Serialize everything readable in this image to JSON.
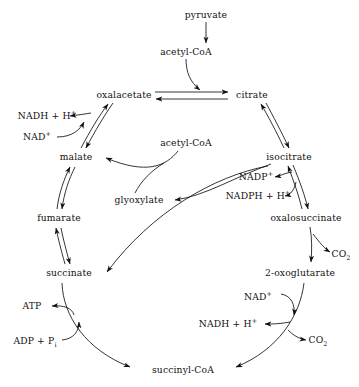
{
  "diagram": {
    "stroke_color": "#111111",
    "background_color": "#ffffff",
    "metabolites": [
      {
        "id": "pyruvate",
        "label": "pyruvate",
        "x": 206,
        "y": 15
      },
      {
        "id": "acetyl-coa-top",
        "label": "acetyl-CoA",
        "x": 186,
        "y": 52
      },
      {
        "id": "oxalacetate",
        "label": "oxalacetate",
        "x": 124,
        "y": 95
      },
      {
        "id": "citrate",
        "label": "citrate",
        "x": 252,
        "y": 95
      },
      {
        "id": "malate",
        "label": "malate",
        "x": 76,
        "y": 157
      },
      {
        "id": "acetyl-coa-mid",
        "label": "acetyl-CoA",
        "x": 186,
        "y": 143
      },
      {
        "id": "isocitrate",
        "label": "isocitrate",
        "x": 289,
        "y": 157
      },
      {
        "id": "glyoxylate",
        "label": "glyoxylate",
        "x": 139,
        "y": 200
      },
      {
        "id": "fumarate",
        "label": "fumarate",
        "x": 59,
        "y": 218
      },
      {
        "id": "oxalosuccinate",
        "label": "oxalosuccinate",
        "x": 306,
        "y": 218
      },
      {
        "id": "succinate",
        "label": "succinate",
        "x": 69,
        "y": 273
      },
      {
        "id": "2-oxoglutarate",
        "label": "2-oxoglutarate",
        "x": 300,
        "y": 273
      },
      {
        "id": "succinyl-coa",
        "label": "succinyl-CoA",
        "x": 183,
        "y": 370
      }
    ],
    "cofactors": [
      {
        "id": "nadh-h-malate",
        "label": "NADH + H",
        "sup": "+",
        "x": 47,
        "y": 116
      },
      {
        "id": "nad-malate",
        "label": "NAD",
        "sup": "+",
        "x": 37,
        "y": 137
      },
      {
        "id": "nadp-isocit",
        "label": "NADP",
        "sup": "+",
        "x": 256,
        "y": 177
      },
      {
        "id": "nadph-h-isocit",
        "label": "NADPH + H",
        "sup": "+",
        "x": 258,
        "y": 196
      },
      {
        "id": "co2-oxalosucc",
        "label": "CO",
        "sub": "2",
        "x": 341,
        "y": 254
      },
      {
        "id": "nad-oxoglut",
        "label": "NAD",
        "sup": "+",
        "x": 258,
        "y": 297
      },
      {
        "id": "nadh-h-oxoglut",
        "label": "NADH + H",
        "sup": "+",
        "x": 228,
        "y": 324
      },
      {
        "id": "co2-oxoglut",
        "label": "CO",
        "sub": "2",
        "x": 318,
        "y": 340
      },
      {
        "id": "atp",
        "label": "ATP",
        "x": 32,
        "y": 306
      },
      {
        "id": "adp-pi",
        "label": "ADP + P",
        "sub": "i",
        "x": 35,
        "y": 341
      }
    ],
    "reactions": [
      {
        "id": "pyruvate-to-acetylcoa",
        "from": "pyruvate",
        "to": "acetyl-coa-top",
        "reversible": false
      },
      {
        "id": "acetylcoa-condensation",
        "from": "acetyl-coa-top",
        "to": "citrate-synthase-point",
        "reversible": false
      },
      {
        "id": "oxalacetate-to-citrate",
        "from": "oxalacetate",
        "to": "citrate",
        "reversible": true
      },
      {
        "id": "citrate-to-isocitrate",
        "from": "citrate",
        "to": "isocitrate",
        "reversible": true
      },
      {
        "id": "isocitrate-to-oxalosuccinate",
        "from": "isocitrate",
        "to": "oxalosuccinate",
        "reversible": true
      },
      {
        "id": "oxalosuccinate-to-oxoglutarate",
        "from": "oxalosuccinate",
        "to": "2-oxoglutarate",
        "reversible": false
      },
      {
        "id": "oxoglutarate-to-succinylcoa",
        "from": "2-oxoglutarate",
        "to": "succinyl-coa",
        "reversible": false
      },
      {
        "id": "succinylcoa-to-succinate",
        "from": "succinyl-coa",
        "to": "succinate",
        "reversible": false
      },
      {
        "id": "succinate-to-fumarate",
        "from": "succinate",
        "to": "fumarate",
        "reversible": true
      },
      {
        "id": "fumarate-to-malate",
        "from": "fumarate",
        "to": "malate",
        "reversible": true
      },
      {
        "id": "malate-to-oxalacetate",
        "from": "malate",
        "to": "oxalacetate",
        "reversible": true
      },
      {
        "id": "isocitrate-to-glyoxylate",
        "from": "isocitrate",
        "to": "glyoxylate",
        "reversible": false
      },
      {
        "id": "isocitrate-to-succinate",
        "from": "isocitrate",
        "to": "succinate",
        "reversible": false
      },
      {
        "id": "glyoxylate-acetylcoa-to-malate",
        "from": "acetyl-coa-mid",
        "to": "malate",
        "reversible": false
      }
    ]
  }
}
